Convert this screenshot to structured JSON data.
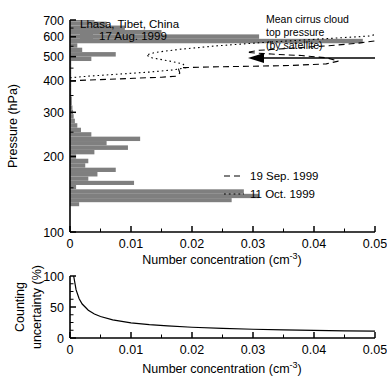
{
  "figure": {
    "title_location": "Lhasa, Tibet, China",
    "gray_hex": "#7f7f7f",
    "line_hex": "#000000"
  },
  "top_panel": {
    "ylabel": "Pressure (hPa)",
    "xlabel": "Number concentration (cm",
    "xlabel_sup": "-3",
    "xlabel_tail": ")",
    "y_ticks": [
      "100",
      "200",
      "300",
      "400",
      "500",
      "600",
      "700"
    ],
    "x_ticks": [
      "0",
      "0.01",
      "0.02",
      "0.03",
      "0.04",
      "0.05"
    ],
    "legend": [
      {
        "label": "17 Aug. 1999",
        "style": "bar"
      },
      {
        "label": "19 Sep. 1999",
        "style": "dashed"
      },
      {
        "label": "11 Oct. 1999",
        "style": "dotted"
      }
    ],
    "annotation": {
      "line1": "Mean cirrus cloud",
      "line2": "top pressure",
      "line3": "(by satellite)"
    }
  },
  "bottom_panel": {
    "ylabel_line1": "Counting",
    "ylabel_line2": "uncertainty (%)",
    "xlabel": "Number concentration (cm",
    "xlabel_sup": "-3",
    "xlabel_tail": ")",
    "y_ticks": [
      "0",
      "50",
      "100"
    ],
    "x_ticks": [
      "0",
      "0.01",
      "0.02",
      "0.03",
      "0.04",
      "0.05"
    ]
  },
  "chart_data": {
    "type": "bar",
    "panels": [
      {
        "name": "top-profile-panel",
        "type": "bar",
        "orientation": "horizontal",
        "xlabel": "Number concentration (cm^-3)",
        "ylabel": "Pressure (hPa)",
        "xlim": [
          0,
          0.05
        ],
        "ylim": [
          700,
          100
        ],
        "yscale": "log",
        "grid": false,
        "legend_position": "top-left and mid-right",
        "series": [
          {
            "name": "17 Aug. 1999",
            "style": "bar",
            "color": "#7f7f7f",
            "pressure_hPa": [
              129,
              134,
              139,
              145,
              151,
              157,
              163,
              170,
              177,
              184,
              192,
              200,
              208,
              217,
              226,
              235,
              245,
              255,
              266,
              277,
              289,
              301,
              313,
              326,
              340,
              354,
              369,
              384,
              400,
              417,
              434,
              452,
              471,
              490,
              511,
              532,
              554,
              577,
              601,
              626,
              652,
              679,
              700
            ],
            "values": [
              0.0015,
              0.0265,
              0.031,
              0.0285,
              0.001,
              0.0105,
              0.003,
              0.0045,
              0.0075,
              0.0025,
              0.003,
              0.001,
              0.004,
              0.0095,
              0.006,
              0.0115,
              0.0035,
              0.0018,
              0.0012,
              0.0008,
              0.0006,
              0.0005,
              0.0004,
              0.0003,
              0.0003,
              0.0002,
              0.0002,
              0.0002,
              0.0002,
              0.0002,
              0.0002,
              0.0002,
              0.0002,
              0.0035,
              0.0075,
              0.002,
              0.0012,
              0.048,
              0.031,
              0.015,
              0.009,
              0.006,
              0.004
            ]
          },
          {
            "name": "19 Sep. 1999",
            "style": "dashed",
            "color": "#000000",
            "points": [
              [
                0.0,
                400
              ],
              [
                0.0015,
                402
              ],
              [
                0.006,
                406
              ],
              [
                0.0105,
                410
              ],
              [
                0.015,
                414
              ],
              [
                0.0175,
                418
              ],
              [
                0.018,
                430
              ],
              [
                0.0178,
                446
              ],
              [
                0.0185,
                452
              ],
              [
                0.023,
                455
              ],
              [
                0.03,
                458
              ],
              [
                0.036,
                461
              ],
              [
                0.042,
                468
              ],
              [
                0.044,
                480
              ],
              [
                0.042,
                495
              ],
              [
                0.038,
                505
              ],
              [
                0.033,
                512
              ],
              [
                0.029,
                520
              ],
              [
                0.031,
                530
              ],
              [
                0.036,
                540
              ],
              [
                0.042,
                552
              ],
              [
                0.047,
                565
              ],
              [
                0.05,
                578
              ]
            ]
          },
          {
            "name": "11 Oct. 1999",
            "style": "dotted",
            "color": "#000000",
            "points": [
              [
                0.0,
                412
              ],
              [
                0.003,
                418
              ],
              [
                0.008,
                426
              ],
              [
                0.013,
                434
              ],
              [
                0.017,
                443
              ],
              [
                0.019,
                452
              ],
              [
                0.0185,
                468
              ],
              [
                0.016,
                482
              ],
              [
                0.0135,
                494
              ],
              [
                0.0125,
                508
              ],
              [
                0.014,
                520
              ],
              [
                0.018,
                535
              ],
              [
                0.024,
                552
              ],
              [
                0.031,
                568
              ],
              [
                0.038,
                582
              ],
              [
                0.044,
                594
              ],
              [
                0.049,
                604
              ],
              [
                0.05,
                612
              ]
            ]
          }
        ],
        "annotations": [
          {
            "text": "Mean cirrus cloud top pressure (by satellite)",
            "arrow_from_x": 0.05,
            "arrow_to_x": 0.032,
            "arrow_pressure_hPa": 158
          }
        ]
      },
      {
        "name": "bottom-uncertainty-panel",
        "type": "line",
        "xlabel": "Number concentration (cm^-3)",
        "ylabel": "Counting uncertainty (%)",
        "xlim": [
          0,
          0.05
        ],
        "ylim": [
          0,
          100
        ],
        "grid": false,
        "relation": "uncertainty ~ k / sqrt(concentration)",
        "series": [
          {
            "name": "counting uncertainty",
            "style": "solid",
            "color": "#000000",
            "x": [
              0.0006,
              0.001,
              0.0015,
              0.002,
              0.003,
              0.004,
              0.005,
              0.007,
              0.01,
              0.013,
              0.016,
              0.02,
              0.025,
              0.03,
              0.035,
              0.04,
              0.045,
              0.05
            ],
            "y": [
              100,
              77.5,
              63.2,
              54.8,
              44.7,
              38.7,
              34.6,
              29.3,
              24.5,
              21.5,
              19.4,
              17.3,
              15.5,
              14.1,
              13.1,
              12.2,
              11.6,
              11.0
            ]
          }
        ]
      }
    ]
  }
}
